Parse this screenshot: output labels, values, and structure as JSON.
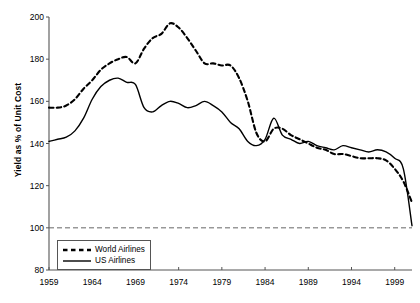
{
  "chart_data": {
    "type": "line",
    "title": "",
    "xlabel": "",
    "ylabel": "Yield as % of Unit Cost",
    "xlim": [
      1959,
      2001
    ],
    "ylim": [
      80,
      200
    ],
    "grid": false,
    "legend_position": "bottom-left-inside",
    "y_ticks": [
      80,
      100,
      120,
      140,
      160,
      180,
      200
    ],
    "x_ticks": [
      1959,
      1964,
      1969,
      1974,
      1979,
      1984,
      1989,
      1994,
      1999
    ],
    "reference_line": {
      "value": 100,
      "style": "dashed",
      "label": ""
    },
    "x": [
      1959,
      1960,
      1961,
      1962,
      1963,
      1964,
      1965,
      1966,
      1967,
      1968,
      1969,
      1970,
      1971,
      1972,
      1973,
      1974,
      1975,
      1976,
      1977,
      1978,
      1979,
      1980,
      1981,
      1982,
      1983,
      1984,
      1985,
      1986,
      1987,
      1988,
      1989,
      1990,
      1991,
      1992,
      1993,
      1994,
      1995,
      1996,
      1997,
      1998,
      1999,
      2000,
      2001
    ],
    "series": [
      {
        "name": "World Airlines",
        "style": "dashed",
        "color": "#000000",
        "values": [
          157,
          157,
          158,
          161,
          166,
          170,
          175,
          178,
          180,
          181,
          178,
          185,
          190,
          192,
          197,
          195,
          190,
          184,
          178,
          178,
          177,
          177,
          171,
          160,
          145,
          141,
          147,
          147,
          144,
          142,
          140,
          138,
          137,
          135,
          135,
          134,
          133,
          133,
          133,
          132,
          128,
          122,
          112
        ]
      },
      {
        "name": "US Airlines",
        "style": "solid",
        "color": "#000000",
        "values": [
          141,
          142,
          143,
          146,
          152,
          161,
          167,
          170,
          171,
          169,
          168,
          157,
          155,
          158,
          160,
          159,
          157,
          158,
          160,
          158,
          155,
          150,
          147,
          141,
          139,
          142,
          152,
          144,
          142,
          140,
          141,
          139,
          138,
          137,
          139,
          138,
          137,
          136,
          137,
          136,
          133,
          128,
          101
        ]
      }
    ]
  },
  "legend": {
    "items": [
      {
        "label": "World Airlines",
        "key": "dashed-line-key"
      },
      {
        "label": "US Airlines",
        "key": "solid-line-key"
      }
    ]
  }
}
